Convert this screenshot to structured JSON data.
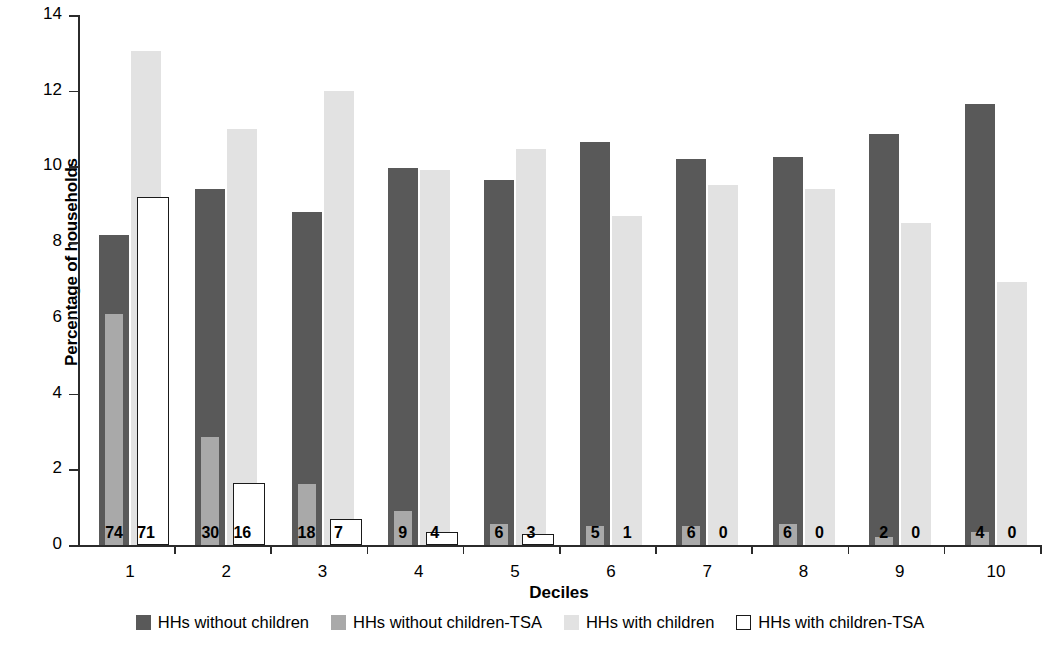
{
  "chart_data": {
    "type": "bar",
    "title": "",
    "xlabel": "Deciles",
    "ylabel": "Percentage of households",
    "categories": [
      "1",
      "2",
      "3",
      "4",
      "5",
      "6",
      "7",
      "8",
      "9",
      "10"
    ],
    "ylim": [
      0,
      14
    ],
    "yticks": [
      0,
      2,
      4,
      6,
      8,
      10,
      12,
      14
    ],
    "grid": false,
    "legend_position": "bottom",
    "series": [
      {
        "name": "HHs without children",
        "color": "#595959",
        "style": "filled-wide",
        "values": [
          8.2,
          9.4,
          8.8,
          9.95,
          9.65,
          10.65,
          10.2,
          10.25,
          10.85,
          11.65
        ]
      },
      {
        "name": "HHs without children-TSA",
        "color": "#a9a9a9",
        "style": "filled-narrow",
        "values": [
          6.1,
          2.85,
          1.6,
          0.9,
          0.55,
          0.5,
          0.5,
          0.55,
          0.2,
          0.35
        ],
        "labels": [
          "74",
          "30",
          "18",
          "9",
          "6",
          "5",
          "6",
          "6",
          "2",
          "4"
        ]
      },
      {
        "name": "HHs with children",
        "color": "#e2e2e2",
        "style": "filled-wide",
        "values": [
          13.05,
          11.0,
          12.0,
          9.9,
          10.45,
          8.7,
          9.5,
          9.4,
          8.5,
          6.95
        ]
      },
      {
        "name": "HHs with children-TSA",
        "color": "#ffffff",
        "style": "outlined-narrow",
        "values": [
          9.2,
          1.65,
          0.7,
          0.35,
          0.3,
          0.0,
          0.0,
          0.0,
          0.0,
          0.0
        ],
        "labels": [
          "71",
          "16",
          "7",
          "4",
          "3",
          "1",
          "0",
          "0",
          "0",
          "0"
        ]
      }
    ]
  },
  "axis": {
    "y_tick_labels": [
      "0",
      "2",
      "4",
      "6",
      "8",
      "10",
      "12",
      "14"
    ],
    "x_tick_labels": [
      "1",
      "2",
      "3",
      "4",
      "5",
      "6",
      "7",
      "8",
      "9",
      "10"
    ],
    "y_title": "Percentage of households",
    "x_title": "Deciles"
  },
  "legend": {
    "items": [
      {
        "label": "HHs without children",
        "swatch": "dark"
      },
      {
        "label": "HHs without children-TSA",
        "swatch": "mid"
      },
      {
        "label": "HHs with children",
        "swatch": "light"
      },
      {
        "label": "HHs with children-TSA",
        "swatch": "open"
      }
    ]
  }
}
